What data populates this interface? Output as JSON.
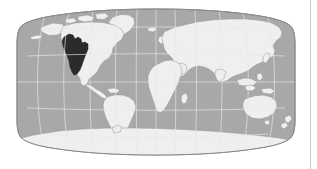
{
  "figure": {
    "kind": "world-map",
    "projection": "Robinson",
    "title": "",
    "background_color": "#ffffff",
    "border_color": "#c9c9c9"
  },
  "map": {
    "ocean_color": "#a8a8a8",
    "ocean_edge_color": "#8a8a8a",
    "land_color": "#efefef",
    "land_edge_color": "#9a9a9a",
    "graticule_color": "#e8e8e8",
    "highlight_color": "#2b2b2b",
    "graticule": {
      "visible": true,
      "meridian_step_degrees": 30,
      "parallel_step_degrees": 30,
      "meridian_labels": [
        "-180",
        "-150",
        "-120",
        "-90",
        "-60",
        "-30",
        "0",
        "30",
        "60",
        "90",
        "120",
        "150",
        "180"
      ],
      "parallel_labels": [
        "-90",
        "-60",
        "-30",
        "0",
        "30",
        "60",
        "90"
      ]
    },
    "extent": {
      "lon_min": -180,
      "lon_max": 180,
      "lat_min": -90,
      "lat_max": 90
    }
  },
  "highlight": {
    "region_name": "western-united-states",
    "continent": "North America",
    "fill": "#2b2b2b",
    "label": ""
  },
  "landmasses": [
    {
      "name": "north-america",
      "fill": "#efefef"
    },
    {
      "name": "south-america",
      "fill": "#efefef"
    },
    {
      "name": "greenland",
      "fill": "#efefef"
    },
    {
      "name": "africa",
      "fill": "#efefef"
    },
    {
      "name": "europe",
      "fill": "#efefef"
    },
    {
      "name": "asia",
      "fill": "#efefef"
    },
    {
      "name": "australia",
      "fill": "#efefef"
    },
    {
      "name": "antarctica",
      "fill": "#efefef"
    },
    {
      "name": "madagascar",
      "fill": "#efefef"
    },
    {
      "name": "japan",
      "fill": "#efefef"
    },
    {
      "name": "new-zealand",
      "fill": "#efefef"
    },
    {
      "name": "british-isles",
      "fill": "#efefef"
    },
    {
      "name": "indonesia",
      "fill": "#efefef"
    },
    {
      "name": "iceland",
      "fill": "#efefef"
    }
  ]
}
